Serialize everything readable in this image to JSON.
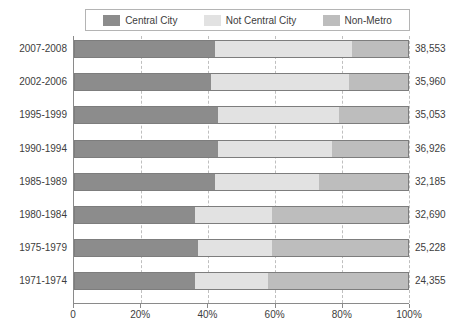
{
  "chart_data": {
    "type": "bar",
    "subtype": "horizontal-stacked-100-percent",
    "title": "",
    "xlabel": "",
    "ylabel": "",
    "xlim": [
      0,
      100
    ],
    "grid": true,
    "legend_position": "top",
    "categories": [
      "2007-2008",
      "2002-2006",
      "1995-1999",
      "1990-1994",
      "1985-1989",
      "1980-1984",
      "1975-1979",
      "1971-1974"
    ],
    "series": [
      {
        "name": "Central City",
        "color": "#8c8c8c",
        "values": [
          42,
          41,
          43,
          43,
          42,
          36,
          37,
          36
        ]
      },
      {
        "name": "Not Central City",
        "color": "#e2e2e2",
        "values": [
          41,
          41,
          36,
          34,
          31,
          23,
          22,
          22
        ]
      },
      {
        "name": "Non-Metro",
        "color": "#bdbdbd",
        "values": [
          17,
          18,
          21,
          23,
          27,
          41,
          41,
          42
        ]
      }
    ],
    "value_labels": [
      "38,553",
      "35,960",
      "35,053",
      "36,926",
      "32,185",
      "32,690",
      "25,228",
      "24,355"
    ],
    "xticks": [
      0,
      20,
      40,
      60,
      80,
      100
    ],
    "xtick_labels": [
      "0",
      "20%",
      "40%",
      "60%",
      "80%",
      "100%"
    ]
  },
  "legend": {
    "items": [
      {
        "label": "Central City",
        "color": "#8c8c8c"
      },
      {
        "label": "Not Central City",
        "color": "#e2e2e2"
      },
      {
        "label": "Non-Metro",
        "color": "#bdbdbd"
      }
    ]
  },
  "colors": {
    "central_city": "#8c8c8c",
    "not_central_city": "#e2e2e2",
    "non_metro": "#bdbdbd",
    "axis": "#8a8a8a",
    "gridline": "#bfbfbf",
    "text": "#3d3d3d",
    "background": "#ffffff"
  }
}
